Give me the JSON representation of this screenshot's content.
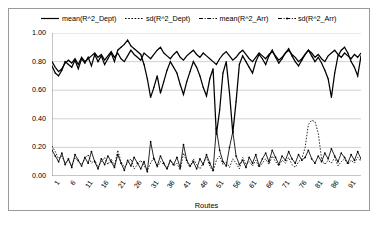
{
  "chart_data": {
    "type": "line",
    "title": "",
    "xlabel": "Routes",
    "ylabel": "",
    "ylim": [
      0.0,
      1.0
    ],
    "ytick_labels": [
      "1.00",
      "0.80",
      "0.60",
      "0.40",
      "0.20",
      "0.00"
    ],
    "ytick_values": [
      1.0,
      0.8,
      0.6,
      0.4,
      0.2,
      0.0
    ],
    "xtick_labels": [
      "1",
      "6",
      "11",
      "16",
      "21",
      "26",
      "31",
      "36",
      "41",
      "46",
      "51",
      "56",
      "61",
      "66",
      "71",
      "76",
      "81",
      "86",
      "91"
    ],
    "xtick_values": [
      1,
      6,
      11,
      16,
      21,
      26,
      31,
      36,
      41,
      46,
      51,
      56,
      61,
      66,
      71,
      76,
      81,
      86,
      91
    ],
    "xlim": [
      1,
      95
    ],
    "grid": "horizontal",
    "legend_position": "top",
    "colors": {
      "line": "#000000",
      "grid": "#bfbfbf",
      "axis": "#808080",
      "frame": "#9a9a9a",
      "background": "#ffffff"
    },
    "x": [
      1,
      2,
      3,
      4,
      5,
      6,
      7,
      8,
      9,
      10,
      11,
      12,
      13,
      14,
      15,
      16,
      17,
      18,
      19,
      20,
      21,
      22,
      23,
      24,
      25,
      26,
      27,
      28,
      29,
      30,
      31,
      32,
      33,
      34,
      35,
      36,
      37,
      38,
      39,
      40,
      41,
      42,
      43,
      44,
      45,
      46,
      47,
      48,
      49,
      50,
      51,
      52,
      53,
      54,
      55,
      56,
      57,
      58,
      59,
      60,
      61,
      62,
      63,
      64,
      65,
      66,
      67,
      68,
      69,
      70,
      71,
      72,
      73,
      74,
      75,
      76,
      77,
      78,
      79,
      80,
      81,
      82,
      83,
      84,
      85,
      86,
      87,
      88,
      89,
      90,
      91,
      92,
      93,
      94,
      95
    ],
    "series": [
      {
        "name": "mean(R^2_Dept)",
        "style": "solid",
        "values": [
          0.8,
          0.76,
          0.73,
          0.75,
          0.79,
          0.81,
          0.79,
          0.82,
          0.78,
          0.83,
          0.8,
          0.82,
          0.84,
          0.86,
          0.83,
          0.85,
          0.81,
          0.84,
          0.87,
          0.83,
          0.86,
          0.82,
          0.8,
          0.84,
          0.88,
          0.85,
          0.83,
          0.81,
          0.86,
          0.84,
          0.82,
          0.85,
          0.88,
          0.9,
          0.86,
          0.84,
          0.82,
          0.85,
          0.87,
          0.83,
          0.81,
          0.84,
          0.86,
          0.88,
          0.85,
          0.83,
          0.86,
          0.84,
          0.82,
          0.8,
          0.78,
          0.82,
          0.85,
          0.87,
          0.84,
          0.81,
          0.83,
          0.86,
          0.88,
          0.85,
          0.82,
          0.8,
          0.83,
          0.86,
          0.84,
          0.82,
          0.85,
          0.87,
          0.84,
          0.81,
          0.83,
          0.86,
          0.88,
          0.85,
          0.83,
          0.8,
          0.82,
          0.85,
          0.88,
          0.86,
          0.83,
          0.85,
          0.82,
          0.8,
          0.84,
          0.86,
          0.88,
          0.85,
          0.83,
          0.86,
          0.84,
          0.82,
          0.85,
          0.83,
          0.86
        ]
      },
      {
        "name": "sd(R^2_Dept)",
        "style": "dotted",
        "values": [
          0.21,
          0.17,
          0.12,
          0.14,
          0.09,
          0.11,
          0.07,
          0.13,
          0.1,
          0.08,
          0.12,
          0.15,
          0.09,
          0.11,
          0.06,
          0.1,
          0.13,
          0.08,
          0.12,
          0.07,
          0.18,
          0.1,
          0.06,
          0.09,
          0.12,
          0.05,
          0.08,
          0.11,
          0.07,
          0.04,
          0.09,
          0.13,
          0.06,
          0.1,
          0.08,
          0.05,
          0.11,
          0.07,
          0.09,
          0.04,
          0.16,
          0.1,
          0.06,
          0.12,
          0.08,
          0.05,
          0.09,
          0.13,
          0.07,
          0.03,
          0.11,
          0.14,
          0.08,
          0.1,
          0.06,
          0.12,
          0.09,
          0.05,
          0.13,
          0.08,
          0.1,
          0.07,
          0.11,
          0.06,
          0.09,
          0.12,
          0.08,
          0.14,
          0.1,
          0.07,
          0.11,
          0.09,
          0.13,
          0.08,
          0.06,
          0.1,
          0.12,
          0.2,
          0.36,
          0.39,
          0.38,
          0.3,
          0.12,
          0.08,
          0.11,
          0.09,
          0.13,
          0.07,
          0.1,
          0.12,
          0.08,
          0.11,
          0.09,
          0.13,
          0.1
        ]
      },
      {
        "name": "mean(R^2_Arr)",
        "style": "dash-dot",
        "values": [
          0.77,
          0.72,
          0.7,
          0.74,
          0.8,
          0.78,
          0.76,
          0.81,
          0.75,
          0.82,
          0.79,
          0.83,
          0.77,
          0.85,
          0.8,
          0.84,
          0.78,
          0.82,
          0.86,
          0.8,
          0.88,
          0.9,
          0.92,
          0.95,
          0.91,
          0.89,
          0.87,
          0.85,
          0.78,
          0.68,
          0.55,
          0.62,
          0.7,
          0.58,
          0.66,
          0.74,
          0.8,
          0.76,
          0.72,
          0.64,
          0.57,
          0.66,
          0.73,
          0.8,
          0.76,
          0.7,
          0.62,
          0.56,
          0.68,
          0.75,
          0.29,
          0.46,
          0.72,
          0.8,
          0.58,
          0.3,
          0.52,
          0.78,
          0.84,
          0.8,
          0.76,
          0.72,
          0.8,
          0.85,
          0.82,
          0.78,
          0.84,
          0.88,
          0.83,
          0.79,
          0.82,
          0.86,
          0.89,
          0.84,
          0.8,
          0.77,
          0.81,
          0.85,
          0.88,
          0.84,
          0.8,
          0.83,
          0.79,
          0.74,
          0.68,
          0.55,
          0.72,
          0.84,
          0.88,
          0.9,
          0.86,
          0.8,
          0.76,
          0.7,
          0.84
        ]
      },
      {
        "name": "sd(R^2_Arr)",
        "style": "dash-dot-marker",
        "values": [
          0.18,
          0.14,
          0.1,
          0.16,
          0.08,
          0.12,
          0.06,
          0.15,
          0.11,
          0.07,
          0.13,
          0.09,
          0.17,
          0.1,
          0.05,
          0.12,
          0.08,
          0.14,
          0.1,
          0.06,
          0.15,
          0.09,
          0.04,
          0.11,
          0.07,
          0.13,
          0.09,
          0.05,
          0.1,
          0.03,
          0.24,
          0.12,
          0.07,
          0.14,
          0.09,
          0.05,
          0.11,
          0.08,
          0.13,
          0.06,
          0.22,
          0.11,
          0.07,
          0.1,
          0.05,
          0.12,
          0.08,
          0.15,
          0.09,
          0.04,
          0.33,
          0.18,
          0.1,
          0.07,
          0.2,
          0.31,
          0.14,
          0.08,
          0.11,
          0.06,
          0.13,
          0.09,
          0.15,
          0.07,
          0.12,
          0.16,
          0.1,
          0.18,
          0.13,
          0.08,
          0.14,
          0.11,
          0.17,
          0.12,
          0.09,
          0.15,
          0.11,
          0.13,
          0.18,
          0.12,
          0.09,
          0.14,
          0.1,
          0.16,
          0.12,
          0.19,
          0.14,
          0.1,
          0.16,
          0.13,
          0.09,
          0.15,
          0.11,
          0.17,
          0.12
        ]
      }
    ]
  }
}
